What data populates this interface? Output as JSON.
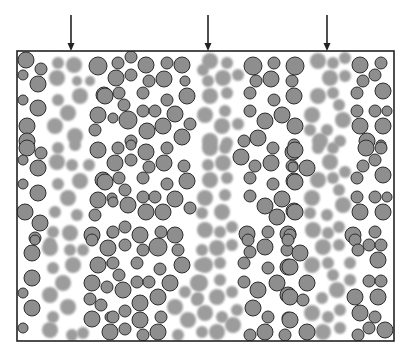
{
  "diagram": {
    "box": {
      "x": 17,
      "y": 51,
      "width": 377,
      "height": 290
    },
    "colors": {
      "outlined_fill": "#8e8e8e",
      "outlined_stroke": "#2e2e2e",
      "faded_fill": "#9c9c9c",
      "border": "#222222",
      "background": "#ffffff"
    },
    "arrows": [
      {
        "x": 71,
        "y1": 15,
        "y2": 51,
        "icon": "down-arrow-icon"
      },
      {
        "x": 208,
        "y1": 15,
        "y2": 51,
        "icon": "down-arrow-icon"
      },
      {
        "x": 327,
        "y1": 15,
        "y2": 51,
        "icon": "down-arrow-icon"
      }
    ],
    "outlined": [
      [
        26,
        60,
        8
      ],
      [
        41,
        69,
        6
      ],
      [
        23,
        75,
        5
      ],
      [
        38,
        84,
        8
      ],
      [
        23,
        100,
        5
      ],
      [
        38,
        108,
        8
      ],
      [
        27,
        126,
        8
      ],
      [
        27,
        141,
        8
      ],
      [
        98,
        66,
        9
      ],
      [
        104,
        95,
        8
      ],
      [
        98,
        115,
        8
      ],
      [
        95,
        130,
        6
      ],
      [
        118,
        63,
        6
      ],
      [
        131,
        57,
        6
      ],
      [
        146,
        65,
        8
      ],
      [
        167,
        63,
        6
      ],
      [
        182,
        65,
        8
      ],
      [
        116,
        78,
        8
      ],
      [
        131,
        75,
        6
      ],
      [
        149,
        81,
        6
      ],
      [
        164,
        79,
        8
      ],
      [
        185,
        81,
        5
      ],
      [
        105,
        96,
        8
      ],
      [
        119,
        93,
        6
      ],
      [
        143,
        93,
        6
      ],
      [
        167,
        100,
        6
      ],
      [
        187,
        96,
        8
      ],
      [
        124,
        105,
        6
      ],
      [
        143,
        111,
        6
      ],
      [
        155,
        111,
        6
      ],
      [
        175,
        114,
        8
      ],
      [
        113,
        118,
        5
      ],
      [
        128,
        120,
        9
      ],
      [
        147,
        131,
        8
      ],
      [
        163,
        126,
        8
      ],
      [
        190,
        124,
        6
      ],
      [
        131,
        141,
        6
      ],
      [
        182,
        137,
        8
      ],
      [
        253,
        66,
        9
      ],
      [
        274,
        63,
        6
      ],
      [
        295,
        66,
        9
      ],
      [
        256,
        81,
        6
      ],
      [
        271,
        79,
        8
      ],
      [
        292,
        81,
        6
      ],
      [
        250,
        93,
        6
      ],
      [
        274,
        100,
        6
      ],
      [
        294,
        96,
        8
      ],
      [
        250,
        111,
        6
      ],
      [
        265,
        121,
        8
      ],
      [
        282,
        115,
        8
      ],
      [
        295,
        126,
        8
      ],
      [
        244,
        141,
        6
      ],
      [
        258,
        138,
        8
      ],
      [
        294,
        145,
        6
      ],
      [
        360,
        65,
        8
      ],
      [
        381,
        63,
        6
      ],
      [
        375,
        75,
        6
      ],
      [
        363,
        81,
        6
      ],
      [
        383,
        91,
        8
      ],
      [
        357,
        93,
        6
      ],
      [
        357,
        111,
        6
      ],
      [
        375,
        111,
        6
      ],
      [
        387,
        111,
        5
      ],
      [
        360,
        126,
        8
      ],
      [
        383,
        126,
        8
      ],
      [
        367,
        141,
        8
      ],
      [
        381,
        145,
        5
      ],
      [
        27,
        148,
        8
      ],
      [
        41,
        153,
        6
      ],
      [
        23,
        160,
        5
      ],
      [
        38,
        168,
        8
      ],
      [
        23,
        184,
        5
      ],
      [
        38,
        193,
        8
      ],
      [
        25,
        212,
        8
      ],
      [
        40,
        223,
        8
      ],
      [
        35,
        238,
        6
      ],
      [
        98,
        150,
        8
      ],
      [
        103,
        180,
        8
      ],
      [
        98,
        200,
        8
      ],
      [
        95,
        215,
        6
      ],
      [
        92,
        235,
        8
      ],
      [
        112,
        198,
        5
      ],
      [
        112,
        233,
        5
      ],
      [
        118,
        148,
        6
      ],
      [
        131,
        145,
        5
      ],
      [
        146,
        152,
        8
      ],
      [
        167,
        148,
        6
      ],
      [
        115,
        163,
        8
      ],
      [
        131,
        160,
        6
      ],
      [
        149,
        167,
        6
      ],
      [
        164,
        163,
        8
      ],
      [
        184,
        166,
        6
      ],
      [
        105,
        182,
        8
      ],
      [
        119,
        178,
        6
      ],
      [
        143,
        178,
        6
      ],
      [
        167,
        184,
        6
      ],
      [
        187,
        181,
        8
      ],
      [
        125,
        190,
        6
      ],
      [
        143,
        197,
        6
      ],
      [
        155,
        197,
        6
      ],
      [
        175,
        199,
        8
      ],
      [
        113,
        202,
        5
      ],
      [
        128,
        205,
        8
      ],
      [
        146,
        212,
        8
      ],
      [
        163,
        212,
        8
      ],
      [
        190,
        208,
        6
      ],
      [
        125,
        227,
        6
      ],
      [
        113,
        232,
        6
      ],
      [
        140,
        235,
        8
      ],
      [
        161,
        232,
        6
      ],
      [
        175,
        235,
        8
      ],
      [
        241,
        157,
        8
      ],
      [
        255,
        166,
        6
      ],
      [
        271,
        163,
        8
      ],
      [
        273,
        148,
        6
      ],
      [
        293,
        152,
        8
      ],
      [
        292,
        166,
        6
      ],
      [
        250,
        178,
        6
      ],
      [
        273,
        184,
        6
      ],
      [
        294,
        181,
        8
      ],
      [
        250,
        196,
        6
      ],
      [
        265,
        206,
        8
      ],
      [
        282,
        199,
        8
      ],
      [
        277,
        217,
        8
      ],
      [
        294,
        211,
        8
      ],
      [
        247,
        234,
        8
      ],
      [
        268,
        232,
        6
      ],
      [
        288,
        234,
        8
      ],
      [
        295,
        150,
        8
      ],
      [
        307,
        168,
        8
      ],
      [
        293,
        167,
        5
      ],
      [
        295,
        182,
        8
      ],
      [
        295,
        212,
        8
      ],
      [
        290,
        235,
        6
      ],
      [
        366,
        148,
        8
      ],
      [
        381,
        148,
        6
      ],
      [
        375,
        160,
        6
      ],
      [
        363,
        166,
        6
      ],
      [
        383,
        175,
        8
      ],
      [
        357,
        178,
        6
      ],
      [
        357,
        197,
        6
      ],
      [
        375,
        197,
        6
      ],
      [
        387,
        197,
        5
      ],
      [
        360,
        212,
        8
      ],
      [
        383,
        212,
        8
      ],
      [
        353,
        235,
        8
      ],
      [
        375,
        232,
        6
      ],
      [
        35,
        240,
        5
      ],
      [
        32,
        253,
        8
      ],
      [
        32,
        278,
        8
      ],
      [
        23,
        293,
        5
      ],
      [
        32,
        308,
        8
      ],
      [
        23,
        328,
        5
      ],
      [
        92,
        240,
        6
      ],
      [
        98,
        265,
        8
      ],
      [
        92,
        283,
        8
      ],
      [
        107,
        287,
        6
      ],
      [
        90,
        299,
        6
      ],
      [
        101,
        305,
        6
      ],
      [
        92,
        319,
        8
      ],
      [
        110,
        332,
        8
      ],
      [
        110,
        317,
        5
      ],
      [
        108,
        248,
        8
      ],
      [
        112,
        263,
        5
      ],
      [
        125,
        245,
        6
      ],
      [
        143,
        250,
        6
      ],
      [
        158,
        247,
        9
      ],
      [
        178,
        250,
        6
      ],
      [
        113,
        263,
        6
      ],
      [
        137,
        263,
        6
      ],
      [
        160,
        269,
        6
      ],
      [
        182,
        265,
        8
      ],
      [
        119,
        275,
        6
      ],
      [
        137,
        282,
        6
      ],
      [
        149,
        282,
        6
      ],
      [
        170,
        283,
        8
      ],
      [
        123,
        290,
        8
      ],
      [
        158,
        297,
        8
      ],
      [
        140,
        303,
        8
      ],
      [
        125,
        311,
        6
      ],
      [
        113,
        317,
        6
      ],
      [
        140,
        320,
        8
      ],
      [
        161,
        317,
        6
      ],
      [
        125,
        329,
        6
      ],
      [
        143,
        335,
        6
      ],
      [
        158,
        332,
        8
      ],
      [
        248,
        240,
        6
      ],
      [
        265,
        247,
        8
      ],
      [
        250,
        252,
        6
      ],
      [
        244,
        263,
        6
      ],
      [
        268,
        268,
        6
      ],
      [
        288,
        267,
        8
      ],
      [
        287,
        250,
        6
      ],
      [
        288,
        240,
        6
      ],
      [
        244,
        282,
        6
      ],
      [
        258,
        290,
        8
      ],
      [
        277,
        283,
        8
      ],
      [
        288,
        295,
        8
      ],
      [
        253,
        308,
        8
      ],
      [
        268,
        317,
        6
      ],
      [
        288,
        318,
        6
      ],
      [
        250,
        335,
        6
      ],
      [
        265,
        332,
        8
      ],
      [
        285,
        335,
        6
      ],
      [
        300,
        253,
        8
      ],
      [
        290,
        267,
        8
      ],
      [
        307,
        283,
        8
      ],
      [
        290,
        297,
        8
      ],
      [
        303,
        300,
        6
      ],
      [
        290,
        320,
        8
      ],
      [
        307,
        332,
        8
      ],
      [
        355,
        240,
        6
      ],
      [
        369,
        245,
        6
      ],
      [
        381,
        245,
        6
      ],
      [
        358,
        250,
        6
      ],
      [
        378,
        260,
        8
      ],
      [
        369,
        281,
        6
      ],
      [
        381,
        281,
        6
      ],
      [
        355,
        297,
        8
      ],
      [
        378,
        297,
        8
      ],
      [
        360,
        313,
        8
      ],
      [
        375,
        317,
        6
      ],
      [
        369,
        328,
        6
      ],
      [
        385,
        330,
        8
      ],
      [
        358,
        335,
        6
      ]
    ],
    "faded": [
      [
        58,
        63,
        6
      ],
      [
        74,
        65,
        8
      ],
      [
        57,
        78,
        8
      ],
      [
        77,
        81,
        5
      ],
      [
        90,
        81,
        5
      ],
      [
        58,
        100,
        6
      ],
      [
        80,
        96,
        8
      ],
      [
        68,
        113,
        8
      ],
      [
        55,
        126,
        8
      ],
      [
        75,
        136,
        8
      ],
      [
        210,
        61,
        8
      ],
      [
        227,
        63,
        6
      ],
      [
        208,
        81,
        6
      ],
      [
        223,
        78,
        8
      ],
      [
        238,
        75,
        6
      ],
      [
        210,
        96,
        8
      ],
      [
        227,
        93,
        6
      ],
      [
        205,
        115,
        8
      ],
      [
        225,
        111,
        6
      ],
      [
        222,
        126,
        8
      ],
      [
        238,
        124,
        6
      ],
      [
        210,
        141,
        8
      ],
      [
        227,
        143,
        6
      ],
      [
        203,
        70,
        6
      ],
      [
        318,
        61,
        8
      ],
      [
        333,
        63,
        6
      ],
      [
        345,
        58,
        6
      ],
      [
        330,
        78,
        8
      ],
      [
        345,
        76,
        6
      ],
      [
        318,
        96,
        8
      ],
      [
        333,
        93,
        6
      ],
      [
        339,
        105,
        6
      ],
      [
        312,
        115,
        8
      ],
      [
        343,
        120,
        8
      ],
      [
        327,
        130,
        6
      ],
      [
        310,
        130,
        6
      ],
      [
        320,
        141,
        8
      ],
      [
        340,
        141,
        6
      ],
      [
        58,
        148,
        6
      ],
      [
        75,
        145,
        6
      ],
      [
        57,
        162,
        8
      ],
      [
        72,
        165,
        6
      ],
      [
        89,
        165,
        6
      ],
      [
        80,
        181,
        8
      ],
      [
        58,
        184,
        6
      ],
      [
        68,
        198,
        8
      ],
      [
        55,
        212,
        6
      ],
      [
        77,
        215,
        6
      ],
      [
        53,
        232,
        6
      ],
      [
        70,
        233,
        8
      ],
      [
        50,
        243,
        6
      ],
      [
        210,
        148,
        8
      ],
      [
        225,
        148,
        6
      ],
      [
        208,
        165,
        6
      ],
      [
        223,
        163,
        8
      ],
      [
        210,
        180,
        8
      ],
      [
        227,
        178,
        6
      ],
      [
        205,
        198,
        8
      ],
      [
        225,
        195,
        6
      ],
      [
        222,
        212,
        8
      ],
      [
        202,
        213,
        6
      ],
      [
        205,
        230,
        8
      ],
      [
        220,
        232,
        6
      ],
      [
        232,
        227,
        6
      ],
      [
        318,
        148,
        6
      ],
      [
        333,
        148,
        6
      ],
      [
        330,
        162,
        8
      ],
      [
        345,
        172,
        6
      ],
      [
        318,
        180,
        8
      ],
      [
        333,
        178,
        6
      ],
      [
        339,
        190,
        6
      ],
      [
        312,
        198,
        8
      ],
      [
        343,
        205,
        8
      ],
      [
        327,
        215,
        6
      ],
      [
        310,
        213,
        6
      ],
      [
        313,
        230,
        8
      ],
      [
        339,
        227,
        6
      ],
      [
        328,
        233,
        6
      ],
      [
        50,
        248,
        8
      ],
      [
        70,
        250,
        6
      ],
      [
        83,
        250,
        6
      ],
      [
        73,
        265,
        8
      ],
      [
        53,
        268,
        6
      ],
      [
        63,
        283,
        8
      ],
      [
        50,
        295,
        8
      ],
      [
        68,
        307,
        8
      ],
      [
        53,
        317,
        6
      ],
      [
        50,
        330,
        8
      ],
      [
        72,
        335,
        6
      ],
      [
        83,
        333,
        6
      ],
      [
        185,
        292,
        6
      ],
      [
        175,
        307,
        8
      ],
      [
        197,
        300,
        6
      ],
      [
        188,
        320,
        8
      ],
      [
        178,
        335,
        6
      ],
      [
        202,
        250,
        6
      ],
      [
        200,
        265,
        6
      ],
      [
        198,
        283,
        8
      ],
      [
        217,
        248,
        8
      ],
      [
        232,
        245,
        6
      ],
      [
        205,
        265,
        8
      ],
      [
        220,
        263,
        6
      ],
      [
        200,
        283,
        8
      ],
      [
        220,
        280,
        6
      ],
      [
        217,
        297,
        8
      ],
      [
        232,
        292,
        6
      ],
      [
        198,
        298,
        6
      ],
      [
        205,
        313,
        8
      ],
      [
        222,
        317,
        6
      ],
      [
        237,
        310,
        6
      ],
      [
        233,
        325,
        8
      ],
      [
        202,
        332,
        6
      ],
      [
        217,
        332,
        8
      ],
      [
        323,
        247,
        8
      ],
      [
        339,
        245,
        6
      ],
      [
        312,
        265,
        8
      ],
      [
        328,
        263,
        6
      ],
      [
        350,
        263,
        6
      ],
      [
        333,
        275,
        6
      ],
      [
        337,
        290,
        8
      ],
      [
        350,
        280,
        6
      ],
      [
        322,
        298,
        6
      ],
      [
        312,
        313,
        8
      ],
      [
        340,
        310,
        6
      ],
      [
        328,
        317,
        6
      ],
      [
        323,
        332,
        8
      ],
      [
        340,
        328,
        6
      ]
    ]
  }
}
